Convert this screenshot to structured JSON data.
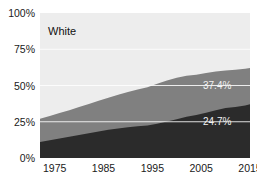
{
  "chart_data": {
    "type": "area",
    "stacked": true,
    "title": "White",
    "xlabel": "",
    "ylabel": "",
    "xlim": [
      1972,
      2015
    ],
    "ylim": [
      0,
      100
    ],
    "grid": true,
    "grid_color": "#ffffff",
    "legend_position": "none",
    "x_tick_labels": [
      "1975",
      "1985",
      "1995",
      "2005",
      "2015"
    ],
    "x_ticks": [
      1975,
      1985,
      1995,
      2005,
      2015
    ],
    "y_tick_labels": [
      "0%",
      "25%",
      "50%",
      "75%",
      "100%"
    ],
    "y_ticks": [
      0,
      25,
      50,
      75,
      100
    ],
    "annotations": [
      {
        "text": "37.4%",
        "x": 2008,
        "y": 50.5,
        "color": "#f2f2f2"
      },
      {
        "text": "24.7%",
        "x": 2008,
        "y": 23.0,
        "color": "#f2f2f2"
      }
    ],
    "x": [
      1972,
      1974,
      1976,
      1978,
      1980,
      1982,
      1984,
      1986,
      1988,
      1990,
      1992,
      1994,
      1996,
      1998,
      2000,
      2002,
      2004,
      2006,
      2008,
      2010,
      2012,
      2014,
      2015
    ],
    "series": [
      {
        "name": "bottom-band",
        "color": "#2b2b2b",
        "label": "24.7%",
        "final_value": 24.7,
        "values": [
          11.0,
          12.2,
          13.4,
          14.6,
          15.9,
          17.1,
          18.3,
          19.4,
          20.3,
          21.2,
          21.9,
          22.4,
          23.6,
          25.2,
          26.8,
          28.4,
          29.6,
          31.2,
          33.0,
          34.4,
          35.2,
          36.2,
          37.0
        ]
      },
      {
        "name": "middle-band",
        "color": "#808080",
        "label": "37.4%",
        "final_value": 37.4,
        "values": [
          16.0,
          16.8,
          17.6,
          18.4,
          19.3,
          20.2,
          21.1,
          22.2,
          23.3,
          24.3,
          25.3,
          26.4,
          27.6,
          28.2,
          28.5,
          28.4,
          27.9,
          27.4,
          26.6,
          26.0,
          25.6,
          25.3,
          25.1
        ]
      },
      {
        "name": "top-band",
        "color": "#ededed",
        "label": "White",
        "values": [
          73.0,
          71.0,
          69.0,
          67.0,
          64.8,
          62.7,
          60.6,
          58.4,
          56.4,
          54.5,
          52.8,
          51.2,
          48.8,
          46.6,
          44.7,
          43.2,
          42.5,
          41.4,
          40.4,
          39.6,
          39.2,
          38.5,
          37.9
        ]
      }
    ]
  },
  "axes": {
    "y_labels": [
      "100%",
      "75%",
      "50%",
      "25%",
      "0%"
    ],
    "x_labels": [
      "1975",
      "1985",
      "1995",
      "2005",
      "2015"
    ]
  },
  "labels": {
    "title": "White",
    "upper_value": "37.4%",
    "lower_value": "24.7%"
  },
  "colors": {
    "background": "#ffffff",
    "top_band": "#ededed",
    "middle_band": "#808080",
    "bottom_band": "#2b2b2b",
    "grid": "#ffffff",
    "text": "#1a1a1a",
    "annotation_text": "#f2f2f2"
  }
}
